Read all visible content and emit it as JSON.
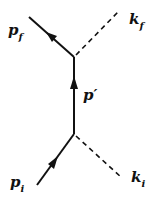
{
  "diagram": {
    "type": "feynman",
    "labels": {
      "p_f": {
        "base": "p",
        "sub": "f"
      },
      "k_f": {
        "base": "k",
        "sub": "f"
      },
      "p_prime": {
        "base": "p′"
      },
      "p_i": {
        "base": "p",
        "sub": "i"
      },
      "k_i": {
        "base": "k",
        "sub": "i"
      }
    },
    "lines": [
      {
        "name": "incoming-fermion",
        "label": "p_i",
        "style": "solid",
        "arrow": true
      },
      {
        "name": "propagator",
        "label": "p'",
        "style": "solid",
        "arrow": true
      },
      {
        "name": "outgoing-fermion",
        "label": "p_f",
        "style": "solid",
        "arrow": true
      },
      {
        "name": "incoming-photon",
        "label": "k_i",
        "style": "dashed"
      },
      {
        "name": "outgoing-photon",
        "label": "k_f",
        "style": "dashed"
      }
    ],
    "colors": {
      "line": "#111111",
      "background": "#ffffff"
    }
  }
}
